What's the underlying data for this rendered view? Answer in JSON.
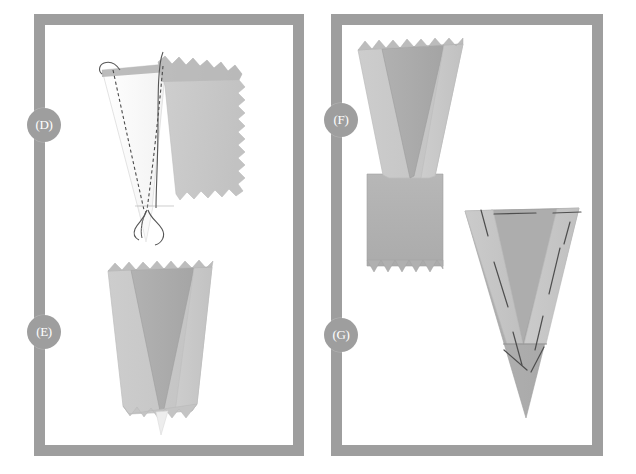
{
  "figure": {
    "background_color": "#ffffff",
    "frame_color": "#9e9e9e",
    "badge_color": "#9e9e9e",
    "badge_text_color": "#ffffff",
    "fabric_light": "#c9c9c9",
    "fabric_mid": "#b3b3b3",
    "fabric_dark": "#a6a6a6",
    "fabric_white": "#fbfbfb",
    "stitch_color": "#4a4a4a",
    "thread_color": "#555555"
  },
  "panels": [
    {
      "id": "panel-left",
      "steps": [
        {
          "id": "step-d",
          "label": "(D)"
        },
        {
          "id": "step-e",
          "label": "(E)"
        }
      ]
    },
    {
      "id": "panel-right",
      "steps": [
        {
          "id": "step-f",
          "label": "(F)"
        },
        {
          "id": "step-g",
          "label": "(G)"
        }
      ]
    }
  ],
  "shapes": {
    "step_d": {
      "name": "cone-with-stitching-and-threads",
      "description": "White folded cone with two dashed stitch lines converging, loose thread tails, overlapped by grey pinked-edge fabric panel",
      "elements": [
        "white-cone",
        "grey-fabric-panel",
        "dashed-stitch-line-left",
        "dashed-stitch-line-right",
        "loose-thread-a",
        "loose-thread-b",
        "loose-thread-c",
        "pinked-top-edge",
        "pinked-right-edge"
      ]
    },
    "step_e": {
      "name": "folded-cone-pinked-edges",
      "description": "Grey funnel shape with darker inner folded triangle and pinked top and bottom edges",
      "elements": [
        "outer-cone-left",
        "outer-cone-right",
        "inner-folded-triangle",
        "pinked-top-edge",
        "pinked-bottom-edge",
        "cone-tip"
      ]
    },
    "step_f": {
      "name": "cone-attached-to-rectangle",
      "description": "Grey funnel shape with darker inner folded triangle joined to a rectangular fabric piece with pinked bottom edge",
      "elements": [
        "outer-cone-left",
        "outer-cone-right",
        "inner-folded-triangle",
        "pinked-top-edge",
        "rectangle-body",
        "pinked-bottom-edge"
      ]
    },
    "step_g": {
      "name": "finished-cone-with-basting-stitches",
      "description": "Grey pointed cone with long dashed basting stitch lines and a horizontal fold line near the lower third",
      "elements": [
        "cone-body",
        "inner-folded-triangle",
        "overlay-left-flap",
        "overlay-right-flap",
        "fold-line",
        "basting-stitch-lines"
      ]
    }
  }
}
